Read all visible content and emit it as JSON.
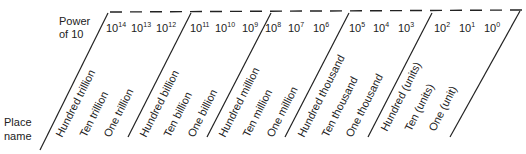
{
  "labels": {
    "power_header_line1": "Power",
    "power_header_line2": "of 10",
    "place_header_line1": "Place",
    "place_header_line2": "name"
  },
  "groups": [
    {
      "name": "trillions",
      "powers": [
        {
          "base": "10",
          "exp": "14"
        },
        {
          "base": "10",
          "exp": "13"
        },
        {
          "base": "10",
          "exp": "12"
        }
      ],
      "places": [
        "Hundred trillion",
        "Ten trillion",
        "One trillion"
      ]
    },
    {
      "name": "billions",
      "powers": [
        {
          "base": "10",
          "exp": "11"
        },
        {
          "base": "10",
          "exp": "10"
        },
        {
          "base": "10",
          "exp": "9"
        }
      ],
      "places": [
        "Hundred billion",
        "Ten billion",
        "One billion"
      ]
    },
    {
      "name": "millions",
      "powers": [
        {
          "base": "10",
          "exp": "8"
        },
        {
          "base": "10",
          "exp": "7"
        },
        {
          "base": "10",
          "exp": "6"
        }
      ],
      "places": [
        "Hundred million",
        "Ten million",
        "One million"
      ]
    },
    {
      "name": "thousands",
      "powers": [
        {
          "base": "10",
          "exp": "5"
        },
        {
          "base": "10",
          "exp": "4"
        },
        {
          "base": "10",
          "exp": "3"
        }
      ],
      "places": [
        "Hundred thousand",
        "Ten thousand",
        "One thousand"
      ]
    },
    {
      "name": "units",
      "powers": [
        {
          "base": "10",
          "exp": "2"
        },
        {
          "base": "10",
          "exp": "1"
        },
        {
          "base": "10",
          "exp": "0"
        }
      ],
      "places": [
        "Hundred (units)",
        "Ten (units)",
        "One (unit)"
      ]
    }
  ]
}
